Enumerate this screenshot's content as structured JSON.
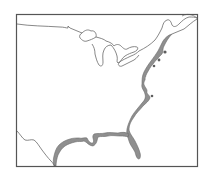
{
  "map": {
    "title": "",
    "region": "Eastern United States",
    "colors": {
      "background": "#ffffff",
      "frame": "#555555",
      "outline": "#6a6a6a",
      "coastal_band_fill": "#8f8f8f",
      "coastal_band_dark": "#5e5e5e"
    },
    "features": [
      {
        "name": "frame",
        "type": "border"
      },
      {
        "name": "us-canada-border",
        "type": "boundary-line"
      },
      {
        "name": "great-lakes",
        "type": "water-outline"
      },
      {
        "name": "us-mexico-border",
        "type": "boundary-line"
      },
      {
        "name": "atlantic-gulf-coastal-band",
        "type": "shaded-region"
      }
    ]
  }
}
